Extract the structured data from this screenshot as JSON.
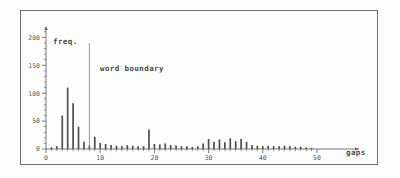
{
  "chart_data": {
    "type": "bar",
    "title": "",
    "subtitle": "",
    "xlabel": "gaps",
    "ylabel": "freq.",
    "xlim": [
      0,
      62
    ],
    "ylim": [
      0,
      215
    ],
    "grid": false,
    "legend": null,
    "x_ticks": [
      0,
      10,
      20,
      30,
      40,
      50
    ],
    "x_tick_labels": [
      "0",
      "10",
      "20",
      "30",
      "40",
      "50"
    ],
    "x_minor_tick_interval": 1,
    "y_ticks": [
      0,
      50,
      100,
      150,
      200
    ],
    "y_tick_labels": [
      "0",
      "50",
      "100",
      "150",
      "200"
    ],
    "y_minor_tick_interval": 10,
    "annotations": [
      {
        "name": "word-boundary",
        "label": "word boundary",
        "type": "vline",
        "x": 8,
        "y_top": 190
      }
    ],
    "categories": [
      1,
      2,
      3,
      4,
      5,
      6,
      7,
      8,
      9,
      10,
      11,
      12,
      13,
      14,
      15,
      16,
      17,
      18,
      19,
      20,
      21,
      22,
      23,
      24,
      25,
      26,
      27,
      28,
      29,
      30,
      31,
      32,
      33,
      34,
      35,
      36,
      37,
      38,
      39,
      40,
      41,
      42,
      43,
      44,
      45,
      46,
      47,
      48,
      49
    ],
    "values": [
      3,
      5,
      60,
      110,
      82,
      40,
      13,
      6,
      22,
      11,
      9,
      7,
      6,
      5,
      7,
      6,
      5,
      5,
      35,
      9,
      8,
      10,
      7,
      6,
      5,
      5,
      4,
      5,
      10,
      18,
      13,
      17,
      12,
      19,
      14,
      18,
      13,
      7,
      6,
      5,
      6,
      5,
      5,
      6,
      5,
      4,
      4,
      3,
      2
    ],
    "xlabel_text": "gaps",
    "ylabel_text": "freq."
  },
  "axis": {
    "y_axis_name": "freq.",
    "x_axis_name": "gaps"
  }
}
